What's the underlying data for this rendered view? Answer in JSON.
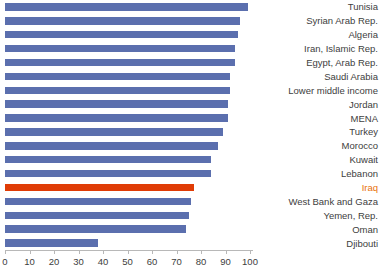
{
  "chart_data": {
    "type": "bar",
    "orientation": "horizontal",
    "title": "",
    "subtitle": "",
    "xlabel": "",
    "ylabel": "",
    "xlim": [
      0,
      100
    ],
    "xticks": [
      0,
      10,
      20,
      30,
      40,
      50,
      60,
      70,
      80,
      90,
      100
    ],
    "grid": false,
    "legend": null,
    "categories": [
      "Tunisia",
      "Syrian Arab Rep.",
      "Algeria",
      "Iran, Islamic Rep.",
      "Egypt, Arab Rep.",
      "Saudi Arabia",
      "Lower middle income",
      "Jordan",
      "MENA",
      "Turkey",
      "Morocco",
      "Kuwait",
      "Lebanon",
      "Iraq",
      "West Bank and Gaza",
      "Yemen, Rep.",
      "Oman",
      "Djibouti"
    ],
    "values": [
      99,
      96,
      95,
      94,
      94,
      92,
      92,
      91,
      91,
      89,
      87,
      84,
      84,
      77,
      76,
      75,
      74,
      38
    ],
    "highlight_category": "Iraq",
    "colors": {
      "bar": "#5b6fae",
      "highlight_bar": "#e03c06",
      "highlight_label": "#e8720c",
      "axis": "#b8b8b8",
      "label_text": "#404040",
      "background": "#ffffff"
    }
  }
}
